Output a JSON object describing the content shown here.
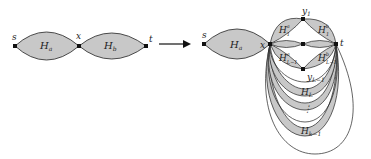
{
  "diagram": {
    "colors": {
      "fill": "#c8c8c8",
      "stroke": "#222222",
      "background": "#ffffff"
    },
    "left": {
      "vertices": {
        "s": "s",
        "x": "x",
        "t": "t"
      },
      "components": {
        "ha": "H",
        "ha_sub": "a",
        "hb": "H",
        "hb_sub": "b"
      }
    },
    "arrow": {
      "label": ""
    },
    "right": {
      "vertices": {
        "s": "s",
        "x": "x",
        "t": "t",
        "y1": "y",
        "y1_sub": "1",
        "yL1": "y",
        "yL1_sub": "L−1"
      },
      "components": {
        "ha": "H",
        "ha_sub": "a",
        "h1a": "H",
        "h1a_sup": "a",
        "h1a_sub": "1",
        "h1b": "H",
        "h1b_sup": "b",
        "h1b_sub": "1",
        "hL1a": "H",
        "hL1a_sup": "a",
        "hL1a_sub": "L−1",
        "hL1b": "H",
        "hL1b_sup": "b",
        "hL1b_sub": "L−1",
        "hL": "H",
        "hL_sub": "L",
        "dots": "⋮",
        "hk1": "H",
        "hk1_sub": "k−1"
      }
    }
  }
}
